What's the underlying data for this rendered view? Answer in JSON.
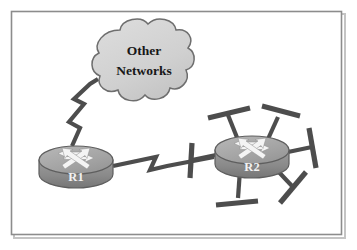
{
  "figure": {
    "type": "network-topology-diagram",
    "title": "",
    "background_color": "#ffffff",
    "frame": {
      "border_color": "#8c8c8c",
      "shadow_color": "#b9b9b9",
      "x": 11,
      "y": 11,
      "width": 331,
      "height": 224
    }
  },
  "cloud": {
    "label_line1": "Other",
    "label_line2": "Networks",
    "fill_color": "#d2d2d2",
    "stroke_color": "#6e6e6e",
    "text_color": "#171717",
    "center_x": 144,
    "center_y": 62
  },
  "routers": [
    {
      "id": "r1",
      "label": "R1",
      "center_x": 76,
      "center_y": 160,
      "radius_x": 37,
      "radius_y": 14,
      "body_height": 22,
      "top_fill": "#a8a8a8",
      "body_fill": "#8a8a8a",
      "stroke_color": "#5e5e5e",
      "arrow_color": "#f4f4f4",
      "label_color": "#f2f2f2"
    },
    {
      "id": "r2",
      "label": "R2",
      "center_x": 252,
      "center_y": 150,
      "radius_x": 37,
      "radius_y": 14,
      "body_height": 22,
      "top_fill": "#a8a8a8",
      "body_fill": "#8a8a8a",
      "stroke_color": "#5e5e5e",
      "arrow_color": "#f4f4f4",
      "label_color": "#f2f2f2"
    }
  ],
  "links": [
    {
      "id": "link-r1-cloud",
      "kind": "serial-lightning-link",
      "from": "r1",
      "to": "cloud",
      "color": "#4d4d4d",
      "width": 4.2
    },
    {
      "id": "link-r1-r2",
      "kind": "serial-lightning-link",
      "from": "r1",
      "to": "r2",
      "color": "#4d4d4d",
      "width": 4.2
    }
  ],
  "ethernet_stubs": {
    "attached_to": "r2",
    "count": 6,
    "color": "#4d4d4d",
    "stem_width": 4.2,
    "bar_width": 5.0,
    "segments": [
      {
        "id": "stub-upper-left",
        "angle_deg": 208
      },
      {
        "id": "stub-upper-right",
        "angle_deg": 318
      },
      {
        "id": "stub-right",
        "angle_deg": 8
      },
      {
        "id": "stub-lower-right",
        "angle_deg": 52
      },
      {
        "id": "stub-lower-left",
        "angle_deg": 104
      },
      {
        "id": "stub-left",
        "angle_deg": 170
      }
    ]
  },
  "colors": {
    "ink": "#4d4d4d",
    "frame": "#8c8c8c",
    "cloud_fill": "#d2d2d2",
    "router_gray": "#8a8a8a",
    "router_top_gray": "#a8a8a8",
    "white": "#ffffff"
  }
}
